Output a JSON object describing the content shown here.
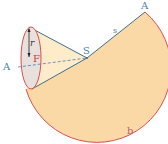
{
  "diagram": {
    "colors": {
      "sector_fill": "#fbd9a6",
      "cone_fill": "#fdebc9",
      "base_fill": "#e8e0dc",
      "arc_stroke": "#d9504c",
      "edge_stroke": "#3f6e92",
      "label_blue": "#4a7fa6",
      "label_red": "#c9413f"
    },
    "labels": {
      "apex": "S",
      "slant_height": "s",
      "radius": "r",
      "base_center": "F",
      "point_left": "A",
      "point_right": "A",
      "arc": "b"
    }
  }
}
